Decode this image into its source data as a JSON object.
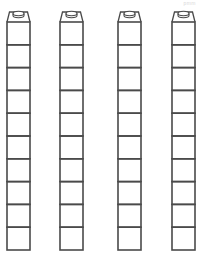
{
  "worksheet": {
    "corner_mark": "pmm",
    "stroke_color": "#4a4a4a",
    "background": "#ffffff",
    "towers": [
      {
        "id": 1,
        "x": 7,
        "cubes": 10
      },
      {
        "id": 2,
        "x": 60,
        "cubes": 10
      },
      {
        "id": 3,
        "x": 118,
        "cubes": 10
      },
      {
        "id": 4,
        "x": 172,
        "cubes": 10
      }
    ],
    "cube_width": 23,
    "cube_height": 22.8,
    "cap_top": 10,
    "body_top": 22
  }
}
